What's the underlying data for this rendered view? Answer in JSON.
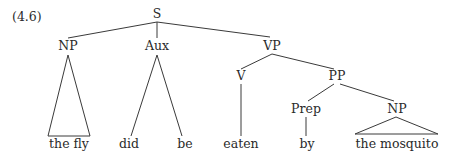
{
  "example_number": "(4.6)",
  "tree": {
    "nodes": [
      {
        "id": "S",
        "label": "S",
        "x": 157,
        "y": 14
      },
      {
        "id": "NP1",
        "label": "NP",
        "x": 68,
        "y": 46
      },
      {
        "id": "Aux",
        "label": "Aux",
        "x": 157,
        "y": 46
      },
      {
        "id": "VP",
        "label": "VP",
        "x": 272,
        "y": 46
      },
      {
        "id": "V",
        "label": "V",
        "x": 241,
        "y": 76
      },
      {
        "id": "PP",
        "label": "PP",
        "x": 337,
        "y": 76
      },
      {
        "id": "Prep",
        "label": "Prep",
        "x": 306,
        "y": 109
      },
      {
        "id": "NP2",
        "label": "NP",
        "x": 397,
        "y": 109
      }
    ],
    "leaves": [
      {
        "id": "the_fly",
        "label": "the fly",
        "x": 69,
        "y": 144
      },
      {
        "id": "did",
        "label": "did",
        "x": 129,
        "y": 144
      },
      {
        "id": "be",
        "label": "be",
        "x": 185,
        "y": 144
      },
      {
        "id": "eaten",
        "label": "eaten",
        "x": 241,
        "y": 144
      },
      {
        "id": "by",
        "label": "by",
        "x": 307,
        "y": 144
      },
      {
        "id": "the_mosquito",
        "label": "the mosquito",
        "x": 397,
        "y": 144
      }
    ]
  }
}
